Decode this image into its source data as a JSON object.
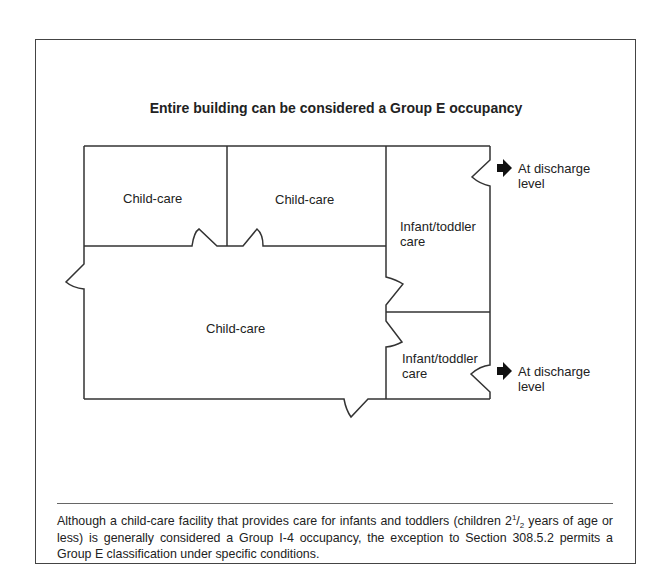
{
  "figure": {
    "title": "Entire building can be considered a Group E occupancy",
    "rooms": [
      {
        "label": "Child-care"
      },
      {
        "label": "Child-care"
      },
      {
        "label": "Infant/toddler care"
      },
      {
        "label": "Child-care"
      },
      {
        "label": "Infant/toddler care"
      }
    ],
    "exits": [
      {
        "icon": "arrow-right-icon",
        "label_line1": "At discharge",
        "label_line2": "level"
      },
      {
        "icon": "arrow-right-icon",
        "label_line1": "At discharge",
        "label_line2": "level"
      }
    ],
    "caption": {
      "part1": "Although a child-care facility that provides care for infants and toddlers (children 2",
      "frac_num": "1",
      "frac_sep": "/",
      "frac_den": "2",
      "part2": " years of age or less) is generally considered a Group I-4 occupancy, the exception to Section 308.5.2 permits a Group E classification under specific conditions."
    }
  }
}
